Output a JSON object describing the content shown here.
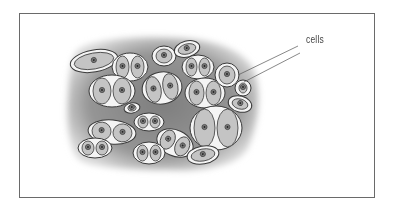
{
  "diagram": {
    "type": "biological-tissue-illustration",
    "labels": [
      {
        "text": "cells",
        "x": 306,
        "y": 41
      }
    ],
    "leader_lines": [
      {
        "from": [
          298,
          46
        ],
        "to": [
          238,
          75
        ]
      },
      {
        "from": [
          300,
          53
        ],
        "to": [
          244,
          82
        ]
      }
    ],
    "colors": {
      "matrix": "#8c8c8c",
      "lacuna": "#f4f4f4",
      "cytoplasm": "#c4c4c4",
      "outline": "#3a3a3a",
      "nucleus": "#7a7a7a",
      "frame": "#6a6a6a"
    },
    "cells": [
      {
        "cx": 94,
        "cy": 61,
        "rx": 24,
        "ry": 11,
        "rot": -10,
        "n": 1
      },
      {
        "cx": 130,
        "cy": 67,
        "rx": 18,
        "ry": 14,
        "rot": 0,
        "n": 2
      },
      {
        "cx": 164,
        "cy": 56,
        "rx": 12,
        "ry": 10,
        "rot": 0,
        "n": 1
      },
      {
        "cx": 187,
        "cy": 49,
        "rx": 13,
        "ry": 8,
        "rot": -15,
        "n": 1
      },
      {
        "cx": 198,
        "cy": 67,
        "rx": 16,
        "ry": 12,
        "rot": 0,
        "n": 2
      },
      {
        "cx": 112,
        "cy": 91,
        "rx": 23,
        "ry": 16,
        "rot": 0,
        "n": 2
      },
      {
        "cx": 162,
        "cy": 88,
        "rx": 20,
        "ry": 16,
        "rot": -10,
        "n": 2
      },
      {
        "cx": 205,
        "cy": 93,
        "rx": 20,
        "ry": 15,
        "rot": 0,
        "n": 2
      },
      {
        "cx": 227,
        "cy": 75,
        "rx": 12,
        "ry": 12,
        "rot": 0,
        "n": 1
      },
      {
        "cx": 243,
        "cy": 88,
        "rx": 8,
        "ry": 8,
        "rot": 0,
        "n": 1
      },
      {
        "cx": 240,
        "cy": 104,
        "rx": 12,
        "ry": 8,
        "rot": 15,
        "n": 1
      },
      {
        "cx": 132,
        "cy": 108,
        "rx": 8,
        "ry": 5,
        "rot": -10,
        "n": 1
      },
      {
        "cx": 149,
        "cy": 122,
        "rx": 15,
        "ry": 9,
        "rot": 0,
        "n": 2
      },
      {
        "cx": 216,
        "cy": 128,
        "rx": 26,
        "ry": 22,
        "rot": 0,
        "n": 2
      },
      {
        "cx": 112,
        "cy": 132,
        "rx": 24,
        "ry": 12,
        "rot": 5,
        "n": 2
      },
      {
        "cx": 175,
        "cy": 143,
        "rx": 19,
        "ry": 13,
        "rot": 25,
        "n": 2
      },
      {
        "cx": 95,
        "cy": 148,
        "rx": 17,
        "ry": 10,
        "rot": 0,
        "n": 2
      },
      {
        "cx": 149,
        "cy": 153,
        "rx": 16,
        "ry": 11,
        "rot": 0,
        "n": 2
      },
      {
        "cx": 203,
        "cy": 155,
        "rx": 16,
        "ry": 9,
        "rot": -10,
        "n": 1
      }
    ]
  }
}
